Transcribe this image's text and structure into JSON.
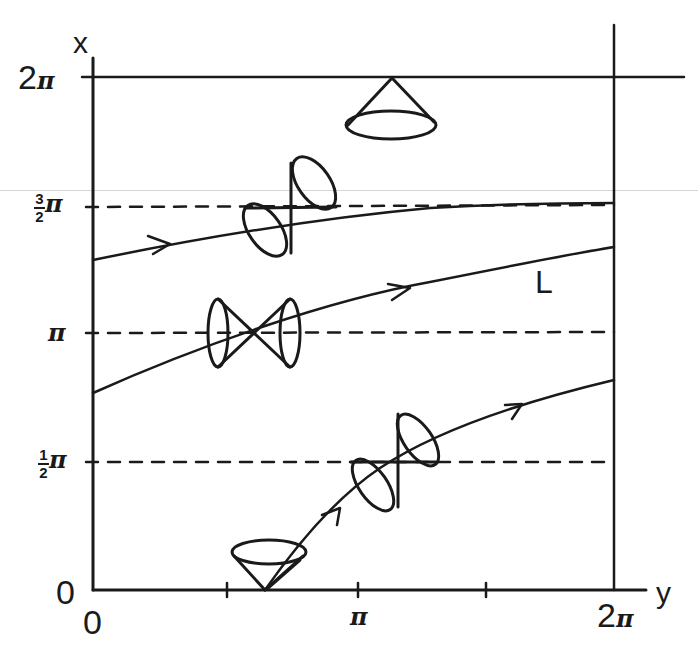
{
  "diagram": {
    "axes": {
      "vertical": {
        "label": "x",
        "ticks": [
          {
            "label_whole": "2",
            "label_symbol": "π",
            "value": "2π"
          },
          {
            "label_num": "3",
            "label_den": "2",
            "label_symbol": "π",
            "value": "3/2π"
          },
          {
            "label_symbol": "π",
            "value": "π"
          },
          {
            "label_num": "1",
            "label_den": "2",
            "label_symbol": "π",
            "value": "1/2π"
          },
          {
            "label_whole": "0",
            "value": "0"
          }
        ]
      },
      "horizontal": {
        "label": "y",
        "ticks": [
          {
            "label_whole": "0",
            "value": "0"
          },
          {
            "label_symbol": "π",
            "value": "π"
          },
          {
            "label_whole": "2",
            "label_symbol": "π",
            "value": "2π"
          }
        ]
      }
    },
    "curves": [
      {
        "name": "upper-curve",
        "from": [
          0,
          "~1.3π"
        ],
        "to": [
          "2π",
          "~1.5π"
        ]
      },
      {
        "name": "curve-L",
        "label": "L",
        "from": [
          0,
          "~0.8π"
        ],
        "to": [
          "2π",
          "~1.35π"
        ]
      },
      {
        "name": "lower-curve",
        "from": [
          "~0.65π",
          0
        ],
        "to": [
          "2π",
          "~0.82π"
        ]
      }
    ],
    "light_cones": [
      {
        "position": "top, on x=2π line",
        "orientation": "upright (opening down)"
      },
      {
        "position": "on x=3/2π line",
        "orientation": "tilted double cone"
      },
      {
        "position": "on x=π line",
        "orientation": "horizontal double cone"
      },
      {
        "position": "on x=1/2π line",
        "orientation": "tilted double cone"
      },
      {
        "position": "bottom, on x=0 axis",
        "orientation": "upright (opening up)"
      }
    ],
    "stroke_color": "#1a1a1a",
    "background_color": "#ffffff"
  }
}
